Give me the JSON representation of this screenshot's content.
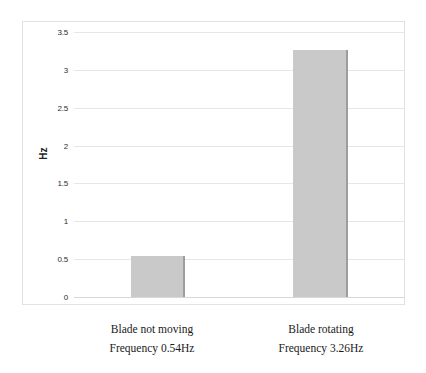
{
  "chart_data": {
    "type": "bar",
    "title": "",
    "subtitle": "",
    "xlabel": "",
    "ylabel": "Hz",
    "ylim": [
      0,
      3.5
    ],
    "ytick_step": 0.5,
    "grid": true,
    "legend": false,
    "categories": [
      "Blade not moving\nFrequency 0.54Hz",
      "Blade rotating\nFrequency 3.26Hz"
    ],
    "values": [
      0.54,
      3.26
    ],
    "yticks": [
      "0",
      "0.5",
      "1",
      "1.5",
      "2",
      "2.5",
      "3",
      "3.5"
    ],
    "ytick_values": [
      0,
      0.5,
      1,
      1.5,
      2,
      2.5,
      3,
      3.5
    ],
    "bar_color": "#c9c9c9",
    "grid_color": "#e6e6e6",
    "frame_color": "#e2e2e2"
  },
  "axis": {
    "y_title": "Hz",
    "ticks": [
      {
        "label": "3.5",
        "value": 3.5
      },
      {
        "label": "3",
        "value": 3
      },
      {
        "label": "2.5",
        "value": 2.5
      },
      {
        "label": "2",
        "value": 2
      },
      {
        "label": "1.5",
        "value": 1.5
      },
      {
        "label": "1",
        "value": 1
      },
      {
        "label": "0.5",
        "value": 0.5
      },
      {
        "label": "0",
        "value": 0
      }
    ]
  },
  "bars": [
    {
      "name": "blade-not-moving",
      "value": 0.54
    },
    {
      "name": "blade-rotating",
      "value": 3.26
    }
  ],
  "category_labels": [
    {
      "line1": "Blade not moving",
      "line2": "Frequency 0.54Hz"
    },
    {
      "line1": "Blade rotating",
      "line2": "Frequency 3.26Hz"
    }
  ]
}
